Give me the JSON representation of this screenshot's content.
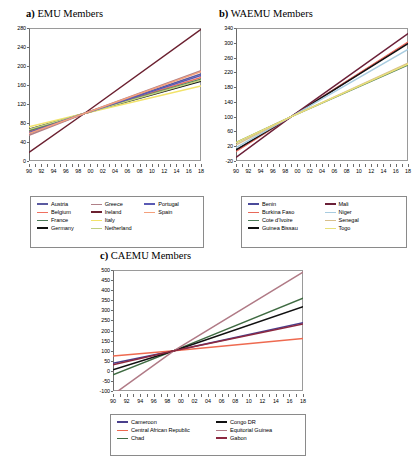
{
  "figure": {
    "background": "#ffffff",
    "width": 418,
    "height": 470
  },
  "panels": [
    {
      "id": "emu",
      "tag": "a)",
      "title": "EMU Members",
      "chart_data": {
        "type": "line",
        "title": "EMU Members",
        "xlabel": "",
        "ylabel": "",
        "xlim": [
          90,
          118
        ],
        "ylim": [
          0,
          280
        ],
        "yticks": [
          0,
          40,
          80,
          120,
          160,
          200,
          240,
          280
        ],
        "xticks": [
          "90",
          "92",
          "94",
          "96",
          "98",
          "00",
          "02",
          "04",
          "06",
          "08",
          "10",
          "12",
          "14",
          "16",
          "18"
        ],
        "grid": false,
        "legend_position": "below",
        "note": "Indexed series, all cross near 100 at 1999",
        "series": [
          {
            "name": "Austria",
            "color": "#5a5aa0",
            "x": [
              1990,
              1999,
              2018
            ],
            "values": [
              57,
              100,
              183
            ]
          },
          {
            "name": "Belgium",
            "color": "#f07060",
            "x": [
              1990,
              1999,
              2018
            ],
            "values": [
              62,
              100,
              176
            ]
          },
          {
            "name": "France",
            "color": "#4a7a56",
            "x": [
              1990,
              1999,
              2018
            ],
            "values": [
              64,
              100,
              172
            ]
          },
          {
            "name": "Germany",
            "color": "#111111",
            "x": [
              1990,
              1999,
              2018
            ],
            "values": [
              67,
              100,
              168
            ]
          },
          {
            "name": "Greece",
            "color": "#b08088",
            "x": [
              1990,
              1999,
              2018
            ],
            "values": [
              54,
              100,
              190
            ]
          },
          {
            "name": "Ireland",
            "color": "#6b2030",
            "x": [
              1990,
              1999,
              2018
            ],
            "values": [
              18,
              100,
              277
            ]
          },
          {
            "name": "Italy",
            "color": "#f2e36a",
            "x": [
              1990,
              1999,
              2018
            ],
            "values": [
              72,
              100,
              158
            ]
          },
          {
            "name": "Netherland",
            "color": "#bfcf80",
            "x": [
              1990,
              1999,
              2018
            ],
            "values": [
              66,
              100,
              170
            ]
          },
          {
            "name": "Portugal",
            "color": "#5a5ab4",
            "x": [
              1990,
              1999,
              2018
            ],
            "values": [
              60,
              100,
              180
            ]
          },
          {
            "name": "Spain",
            "color": "#f4a07c",
            "x": [
              1990,
              1999,
              2018
            ],
            "values": [
              58,
              100,
              188
            ]
          }
        ]
      },
      "legend": {
        "columns": 3,
        "items": [
          {
            "label": "Austria",
            "color": "#5a5aa0",
            "thick": true
          },
          {
            "label": "Belgium",
            "color": "#f07060",
            "thick": false
          },
          {
            "label": "France",
            "color": "#4a7a56",
            "thick": false
          },
          {
            "label": "Germany",
            "color": "#111111",
            "thick": true
          },
          {
            "label": "Greece",
            "color": "#b08088",
            "thick": false
          },
          {
            "label": "Ireland",
            "color": "#6b2030",
            "thick": true
          },
          {
            "label": "Italy",
            "color": "#f2e36a",
            "thick": false
          },
          {
            "label": "Netherland",
            "color": "#bfcf80",
            "thick": false
          },
          {
            "label": "Portugal",
            "color": "#5a5ab4",
            "thick": true
          },
          {
            "label": "Spain",
            "color": "#f4a07c",
            "thick": false
          }
        ]
      }
    },
    {
      "id": "waemu",
      "tag": "b)",
      "title": "WAEMU Members",
      "chart_data": {
        "type": "line",
        "title": "WAEMU Members",
        "xlabel": "",
        "ylabel": "",
        "xlim": [
          90,
          118
        ],
        "ylim": [
          -20,
          340
        ],
        "yticks": [
          -20,
          20,
          60,
          100,
          140,
          180,
          220,
          260,
          300,
          340
        ],
        "xticks": [
          "90",
          "92",
          "94",
          "96",
          "98",
          "00",
          "02",
          "04",
          "06",
          "08",
          "10",
          "12",
          "14",
          "16",
          "18"
        ],
        "grid": false,
        "legend_position": "below",
        "note": "Indexed series, all cross near 100 at 1999",
        "series": [
          {
            "name": "Benin",
            "color": "#4a4a9a",
            "x": [
              1990,
              1999,
              2018
            ],
            "values": [
              8,
              100,
              300
            ]
          },
          {
            "name": "Burkina Faso",
            "color": "#e8695a",
            "x": [
              1990,
              1999,
              2018
            ],
            "values": [
              6,
              100,
              302
            ]
          },
          {
            "name": "Cote d'Ivoire",
            "color": "#4a7a56",
            "x": [
              1990,
              1999,
              2018
            ],
            "values": [
              30,
              100,
              240
            ]
          },
          {
            "name": "Guinea Bissau",
            "color": "#111111",
            "x": [
              1990,
              1999,
              2018
            ],
            "values": [
              10,
              100,
              298
            ]
          },
          {
            "name": "Mali",
            "color": "#6b2038",
            "x": [
              1990,
              1999,
              2018
            ],
            "values": [
              -10,
              100,
              325
            ]
          },
          {
            "name": "Niger",
            "color": "#a8cce0",
            "x": [
              1990,
              1999,
              2018
            ],
            "values": [
              16,
              100,
              282
            ]
          },
          {
            "name": "Senegal",
            "color": "#d8bf8a",
            "x": [
              1990,
              1999,
              2018
            ],
            "values": [
              24,
              100,
              245
            ]
          },
          {
            "name": "Togo",
            "color": "#e8e07a",
            "x": [
              1990,
              1999,
              2018
            ],
            "values": [
              30,
              100,
              242
            ]
          }
        ]
      },
      "legend": {
        "columns": 2,
        "items": [
          {
            "label": "Benin",
            "color": "#4a4a9a",
            "thick": true
          },
          {
            "label": "Burkina Faso",
            "color": "#e8695a",
            "thick": false
          },
          {
            "label": "Cote d'Ivoire",
            "color": "#4a7a56",
            "thick": false
          },
          {
            "label": "Guinea Bissau",
            "color": "#111111",
            "thick": true
          },
          {
            "label": "Mali",
            "color": "#6b2038",
            "thick": true
          },
          {
            "label": "Niger",
            "color": "#a8cce0",
            "thick": false
          },
          {
            "label": "Senegal",
            "color": "#d8bf8a",
            "thick": false
          },
          {
            "label": "Togo",
            "color": "#e8e07a",
            "thick": false
          }
        ]
      }
    },
    {
      "id": "caemu",
      "tag": "c)",
      "title": "CAEMU Members",
      "chart_data": {
        "type": "line",
        "title": "CAEMU Members",
        "xlabel": "",
        "ylabel": "",
        "xlim": [
          90,
          118
        ],
        "ylim": [
          -100,
          500
        ],
        "yticks": [
          -100,
          -50,
          0,
          50,
          100,
          150,
          200,
          250,
          300,
          350,
          400,
          450,
          500
        ],
        "xticks": [
          "90",
          "92",
          "94",
          "96",
          "98",
          "00",
          "02",
          "04",
          "06",
          "08",
          "10",
          "12",
          "14",
          "16",
          "18"
        ],
        "grid": false,
        "legend_position": "below",
        "note": "Indexed series, all cross near 100 at 1999",
        "series": [
          {
            "name": "Cameroon",
            "color": "#4a3f8c",
            "x": [
              1990,
              1999,
              2018
            ],
            "values": [
              38,
              100,
              238
            ]
          },
          {
            "name": "Central African Republic",
            "color": "#ee6a50",
            "x": [
              1990,
              1999,
              2018
            ],
            "values": [
              74,
              100,
              160
            ]
          },
          {
            "name": "Chad",
            "color": "#3f6b42",
            "x": [
              1990,
              1999,
              2018
            ],
            "values": [
              -20,
              100,
              360
            ]
          },
          {
            "name": "Congo DR",
            "color": "#111111",
            "x": [
              1990,
              1999,
              2018
            ],
            "values": [
              5,
              100,
              318
            ]
          },
          {
            "name": "Equitorial Guinea",
            "color": "#b07a86",
            "x": [
              1990,
              1999,
              2018
            ],
            "values": [
              -118,
              100,
              490
            ]
          },
          {
            "name": "Gabon",
            "color": "#8c2840",
            "x": [
              1990,
              1999,
              2018
            ],
            "values": [
              30,
              100,
              232
            ]
          }
        ]
      },
      "legend": {
        "columns": 2,
        "items": [
          {
            "label": "Cameroon",
            "color": "#4a3f8c",
            "thick": true
          },
          {
            "label": "Central African Republic",
            "color": "#ee6a50",
            "thick": false
          },
          {
            "label": "Chad",
            "color": "#3f6b42",
            "thick": false
          },
          {
            "label": "Congo DR",
            "color": "#111111",
            "thick": true
          },
          {
            "label": "Equitorial Guinea",
            "color": "#b07a86",
            "thick": false
          },
          {
            "label": "Gabon",
            "color": "#8c2840",
            "thick": true
          }
        ]
      }
    }
  ]
}
